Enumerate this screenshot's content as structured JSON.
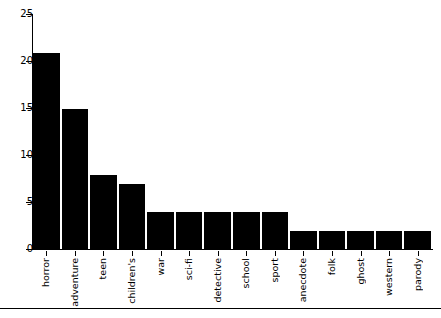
{
  "chart_data": {
    "type": "bar",
    "title": "",
    "subtitle": "",
    "xlabel": "",
    "ylabel": "",
    "categories": [
      "horror",
      "adventure",
      "teen",
      "children's",
      "war",
      "sci-fi",
      "detective",
      "school",
      "sport",
      "anecdote",
      "folk",
      "ghost",
      "western",
      "parody"
    ],
    "values": [
      21,
      15,
      8,
      7,
      4,
      4,
      4,
      4,
      4,
      2,
      2,
      2,
      2,
      2
    ],
    "ylim": [
      0,
      25
    ],
    "yticks": [
      0,
      5,
      10,
      15,
      20,
      25
    ],
    "ytick_labels": [
      "0",
      "5",
      "10",
      "15",
      "20",
      "25"
    ],
    "grid": false,
    "legend": null,
    "bar_color": "#000000",
    "axis_color": "#000000",
    "background_color": "#ffffff",
    "annotations": []
  }
}
